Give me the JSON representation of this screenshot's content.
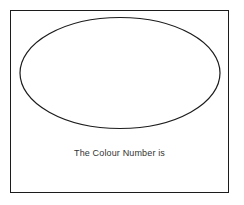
{
  "canvas": {
    "width": 244,
    "height": 205,
    "background_color": "#ffffff"
  },
  "frame": {
    "name": "worksheet-border",
    "stroke_color": "#1c1c1c",
    "stroke_width": 1,
    "fill_color": "#ffffff",
    "x": 10,
    "y": 10,
    "width": 219,
    "height": 183
  },
  "shapes": [
    {
      "type": "ellipse",
      "icon": "ellipse-outline-icon",
      "label": "",
      "center_x": 120,
      "center_y": 73,
      "radius_x": 100,
      "radius_y": 55.5,
      "stroke_color": "#1c1c1c",
      "stroke_width": 1.2,
      "fill": "none"
    }
  ],
  "caption": {
    "text": "The Colour Number is",
    "color": "#333333",
    "font_size_px": 9,
    "align": "center"
  }
}
